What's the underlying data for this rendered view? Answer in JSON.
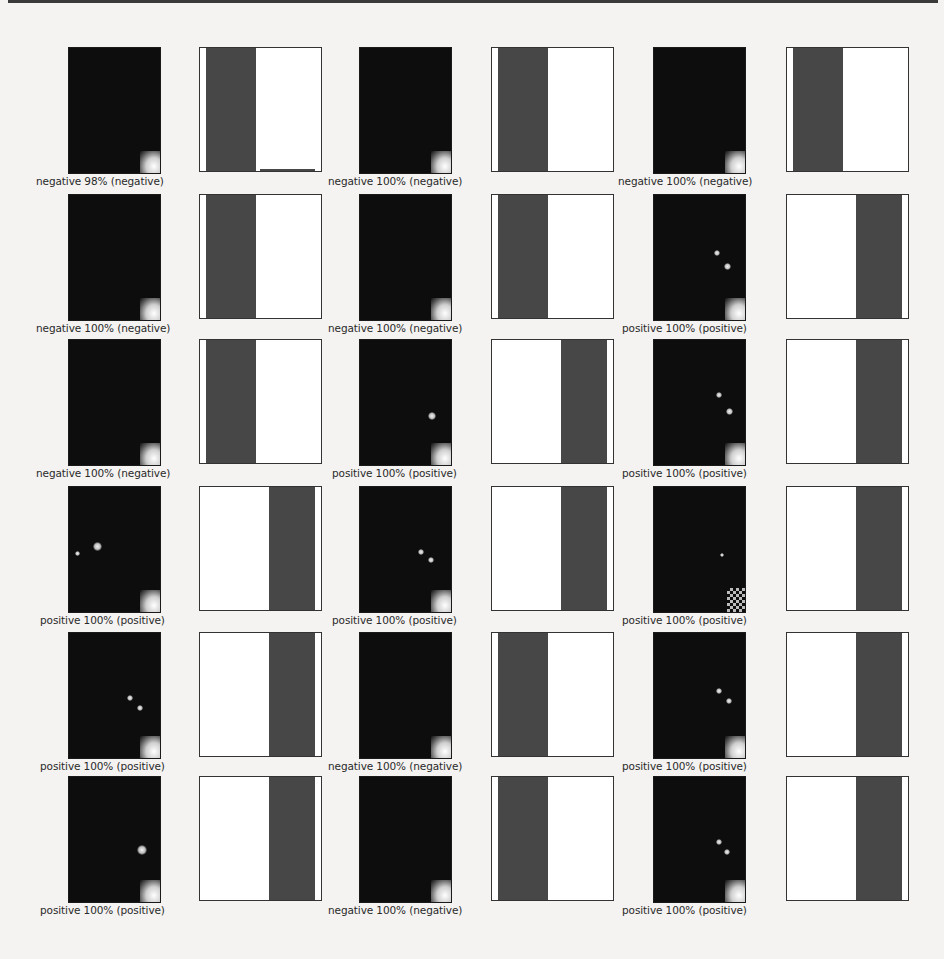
{
  "figure": {
    "rows": 6,
    "cols": 3,
    "classes": [
      "negative",
      "positive"
    ],
    "colors": {
      "bar": "#474747",
      "image_bg": "#0d0d0d",
      "box_bg": "#ffffff",
      "border": "#333333"
    }
  },
  "panels": [
    {
      "caption": "negative 98% (negative)",
      "pred": "negative",
      "pct": 98,
      "truth": "negative"
    },
    {
      "caption": "negative 100% (negative)",
      "pred": "negative",
      "pct": 100,
      "truth": "negative"
    },
    {
      "caption": "negative 100% (negative)",
      "pred": "negative",
      "pct": 100,
      "truth": "negative"
    },
    {
      "caption": "negative 100% (negative)",
      "pred": "negative",
      "pct": 100,
      "truth": "negative"
    },
    {
      "caption": "negative 100% (negative)",
      "pred": "negative",
      "pct": 100,
      "truth": "negative"
    },
    {
      "caption": "positive 100% (positive)",
      "pred": "positive",
      "pct": 100,
      "truth": "positive"
    },
    {
      "caption": "negative 100% (negative)",
      "pred": "negative",
      "pct": 100,
      "truth": "negative"
    },
    {
      "caption": "positive 100% (positive)",
      "pred": "positive",
      "pct": 100,
      "truth": "positive"
    },
    {
      "caption": "positive 100% (positive)",
      "pred": "positive",
      "pct": 100,
      "truth": "positive"
    },
    {
      "caption": "positive 100% (positive)",
      "pred": "positive",
      "pct": 100,
      "truth": "positive"
    },
    {
      "caption": "positive 100% (positive)",
      "pred": "positive",
      "pct": 100,
      "truth": "positive"
    },
    {
      "caption": "positive 100% (positive)",
      "pred": "positive",
      "pct": 100,
      "truth": "positive"
    },
    {
      "caption": "positive 100% (positive)",
      "pred": "positive",
      "pct": 100,
      "truth": "positive"
    },
    {
      "caption": "negative 100% (negative)",
      "pred": "negative",
      "pct": 100,
      "truth": "negative"
    },
    {
      "caption": "positive 100% (positive)",
      "pred": "positive",
      "pct": 100,
      "truth": "positive"
    },
    {
      "caption": "positive 100% (positive)",
      "pred": "positive",
      "pct": 100,
      "truth": "positive"
    },
    {
      "caption": "negative 100% (negative)",
      "pred": "negative",
      "pct": 100,
      "truth": "negative"
    },
    {
      "caption": "positive 100% (positive)",
      "pred": "positive",
      "pct": 100,
      "truth": "positive"
    }
  ],
  "chart_data": {
    "type": "bar",
    "title": "",
    "categories": [
      "negative",
      "positive"
    ],
    "xlabel": "",
    "ylabel": "",
    "ylim": [
      0,
      1
    ],
    "grid": false,
    "series": [
      {
        "name": "panel 1",
        "values": [
          0.98,
          0.02
        ]
      },
      {
        "name": "panel 2",
        "values": [
          1.0,
          0.0
        ]
      },
      {
        "name": "panel 3",
        "values": [
          1.0,
          0.0
        ]
      },
      {
        "name": "panel 4",
        "values": [
          1.0,
          0.0
        ]
      },
      {
        "name": "panel 5",
        "values": [
          1.0,
          0.0
        ]
      },
      {
        "name": "panel 6",
        "values": [
          0.0,
          1.0
        ]
      },
      {
        "name": "panel 7",
        "values": [
          1.0,
          0.0
        ]
      },
      {
        "name": "panel 8",
        "values": [
          0.0,
          1.0
        ]
      },
      {
        "name": "panel 9",
        "values": [
          0.0,
          1.0
        ]
      },
      {
        "name": "panel 10",
        "values": [
          0.0,
          1.0
        ]
      },
      {
        "name": "panel 11",
        "values": [
          0.0,
          1.0
        ]
      },
      {
        "name": "panel 12",
        "values": [
          0.0,
          1.0
        ]
      },
      {
        "name": "panel 13",
        "values": [
          0.0,
          1.0
        ]
      },
      {
        "name": "panel 14",
        "values": [
          1.0,
          0.0
        ]
      },
      {
        "name": "panel 15",
        "values": [
          0.0,
          1.0
        ]
      },
      {
        "name": "panel 16",
        "values": [
          0.0,
          1.0
        ]
      },
      {
        "name": "panel 17",
        "values": [
          1.0,
          0.0
        ]
      },
      {
        "name": "panel 18",
        "values": [
          0.0,
          1.0
        ]
      }
    ]
  }
}
